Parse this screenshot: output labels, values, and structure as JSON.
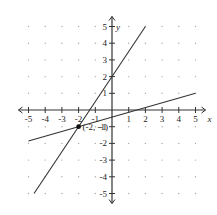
{
  "chart_data": {
    "type": "line",
    "title": "",
    "xlabel": "x",
    "ylabel": "y",
    "xlim": [
      -5,
      5
    ],
    "ylim": [
      -5,
      5
    ],
    "grid": "dots",
    "x_ticks": [
      -5,
      -4,
      -3,
      -2,
      -1,
      1,
      2,
      3,
      4,
      5
    ],
    "y_ticks": [
      -5,
      -4,
      -3,
      -2,
      -1,
      1,
      2,
      3,
      4,
      5
    ],
    "series": [
      {
        "name": "steep line",
        "equation": "y = 1.5x + 2",
        "points": [
          [
            -4.67,
            -5
          ],
          [
            2,
            5
          ]
        ]
      },
      {
        "name": "shallow line",
        "equation": "y = (2/7)x - 3/7",
        "points": [
          [
            -5,
            -1.86
          ],
          [
            5,
            1
          ]
        ]
      }
    ],
    "annotations": [
      {
        "text": "(-2, -1)",
        "x": -2,
        "y": -1,
        "marker": "filled-dot"
      }
    ]
  },
  "labels": {
    "x_axis": "x",
    "y_axis": "y",
    "point": "(-2, -1)"
  }
}
